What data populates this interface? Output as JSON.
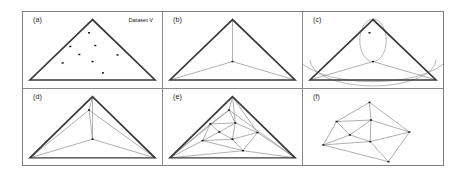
{
  "figure": {
    "width": 466,
    "height": 177,
    "background": "#ffffff",
    "frame_color": "#7d7d7d",
    "divider_color": "#8a8a8a"
  },
  "style": {
    "hull_color": "#3a3a3a",
    "hull_width": 1.5,
    "edge_color": "#8f8f8f",
    "edge_width": 0.6,
    "arc_color": "#9a9a9a",
    "arc_width": 0.6,
    "point_color": "#111111",
    "point_size": 1.5
  },
  "panels": [
    {
      "id": "a",
      "label": "(a)",
      "caption": "Dataset V",
      "has_caption": true,
      "super_triangle": [
        [
          50,
          8
        ],
        [
          5,
          72
        ],
        [
          95,
          72
        ]
      ],
      "show_hull": true,
      "show_super_edges": false,
      "points": [
        [
          47.5,
          22.0
        ],
        [
          34.0,
          36.5
        ],
        [
          52.0,
          35.5
        ],
        [
          40.5,
          45.0
        ],
        [
          28.5,
          54.0
        ],
        [
          50.0,
          52.5
        ],
        [
          68.0,
          45.5
        ],
        [
          57.5,
          64.5
        ]
      ],
      "edges": [],
      "arcs": []
    },
    {
      "id": "b",
      "label": "(b)",
      "caption": "",
      "has_caption": false,
      "super_triangle": [
        [
          50,
          8
        ],
        [
          5,
          72
        ],
        [
          95,
          72
        ]
      ],
      "show_hull": true,
      "show_super_edges": true,
      "points": [
        [
          50.0,
          52.5
        ]
      ],
      "edges": [
        [
          [
            50.0,
            52.5
          ],
          [
            50.0,
            8.0
          ]
        ],
        [
          [
            50.0,
            52.5
          ],
          [
            5.0,
            72.0
          ]
        ],
        [
          [
            50.0,
            52.5
          ],
          [
            95.0,
            72.0
          ]
        ]
      ],
      "arcs": []
    },
    {
      "id": "c",
      "label": "(c)",
      "caption": "",
      "has_caption": false,
      "super_triangle": [
        [
          50,
          8
        ],
        [
          5,
          72
        ],
        [
          95,
          72
        ]
      ],
      "show_hull": true,
      "show_super_edges": true,
      "points": [
        [
          47.5,
          22.0
        ],
        [
          50.0,
          52.5
        ]
      ],
      "edges": [
        [
          [
            50.0,
            52.5
          ],
          [
            5.0,
            72.0
          ]
        ],
        [
          [
            50.0,
            52.5
          ],
          [
            95.0,
            72.0
          ]
        ]
      ],
      "arcs": [
        {
          "cx": 50.0,
          "cy": 30.0,
          "r": 22.5,
          "sweep": "lens-left"
        },
        {
          "cx": 50.0,
          "cy": 30.0,
          "r": 22.5,
          "sweep": "lens-right"
        },
        {
          "cx": 50.0,
          "cy": 28.0,
          "r": 45.0,
          "sweep": "bottom-wide"
        },
        {
          "cx": 50.0,
          "cy": 20.0,
          "r": 55.0,
          "sweep": "bottom-wider"
        }
      ]
    },
    {
      "id": "d",
      "label": "(d)",
      "caption": "",
      "has_caption": false,
      "super_triangle": [
        [
          50,
          8
        ],
        [
          5,
          72
        ],
        [
          95,
          72
        ]
      ],
      "show_hull": true,
      "show_super_edges": true,
      "points": [
        [
          47.5,
          22.0
        ],
        [
          50.0,
          52.5
        ]
      ],
      "edges": [
        [
          [
            47.5,
            22.0
          ],
          [
            50.0,
            8.0
          ]
        ],
        [
          [
            47.5,
            22.0
          ],
          [
            5.0,
            72.0
          ]
        ],
        [
          [
            47.5,
            22.0
          ],
          [
            95.0,
            72.0
          ]
        ],
        [
          [
            47.5,
            22.0
          ],
          [
            50.0,
            52.5
          ]
        ],
        [
          [
            50.0,
            52.5
          ],
          [
            5.0,
            72.0
          ]
        ],
        [
          [
            50.0,
            52.5
          ],
          [
            95.0,
            72.0
          ]
        ],
        [
          [
            50.0,
            52.5
          ],
          [
            50.0,
            8.0
          ]
        ]
      ],
      "arcs": []
    },
    {
      "id": "e",
      "label": "(e)",
      "caption": "",
      "has_caption": false,
      "super_triangle": [
        [
          50,
          8
        ],
        [
          5,
          72
        ],
        [
          95,
          72
        ]
      ],
      "show_hull": true,
      "show_super_edges": true,
      "points": [
        [
          47.5,
          22.0
        ],
        [
          34.0,
          36.5
        ],
        [
          52.0,
          35.5
        ],
        [
          40.5,
          45.0
        ],
        [
          28.5,
          54.0
        ],
        [
          50.0,
          52.5
        ],
        [
          68.0,
          45.5
        ],
        [
          57.5,
          64.5
        ]
      ],
      "edges": [
        [
          [
            47.5,
            22.0
          ],
          [
            50.0,
            8.0
          ]
        ],
        [
          [
            47.5,
            22.0
          ],
          [
            34.0,
            36.5
          ]
        ],
        [
          [
            47.5,
            22.0
          ],
          [
            52.0,
            35.5
          ]
        ],
        [
          [
            34.0,
            36.5
          ],
          [
            52.0,
            35.5
          ]
        ],
        [
          [
            34.0,
            36.5
          ],
          [
            40.5,
            45.0
          ]
        ],
        [
          [
            34.0,
            36.5
          ],
          [
            28.5,
            54.0
          ]
        ],
        [
          [
            52.0,
            35.5
          ],
          [
            40.5,
            45.0
          ]
        ],
        [
          [
            52.0,
            35.5
          ],
          [
            50.0,
            52.5
          ]
        ],
        [
          [
            52.0,
            35.5
          ],
          [
            68.0,
            45.5
          ]
        ],
        [
          [
            40.5,
            45.0
          ],
          [
            50.0,
            52.5
          ]
        ],
        [
          [
            40.5,
            45.0
          ],
          [
            28.5,
            54.0
          ]
        ],
        [
          [
            28.5,
            54.0
          ],
          [
            50.0,
            52.5
          ]
        ],
        [
          [
            28.5,
            54.0
          ],
          [
            57.5,
            64.5
          ]
        ],
        [
          [
            28.5,
            54.0
          ],
          [
            5.0,
            72.0
          ]
        ],
        [
          [
            50.0,
            52.5
          ],
          [
            68.0,
            45.5
          ]
        ],
        [
          [
            50.0,
            52.5
          ],
          [
            57.5,
            64.5
          ]
        ],
        [
          [
            68.0,
            45.5
          ],
          [
            57.5,
            64.5
          ]
        ],
        [
          [
            68.0,
            45.5
          ],
          [
            95.0,
            72.0
          ]
        ],
        [
          [
            57.5,
            64.5
          ],
          [
            5.0,
            72.0
          ]
        ],
        [
          [
            57.5,
            64.5
          ],
          [
            95.0,
            72.0
          ]
        ],
        [
          [
            34.0,
            36.5
          ],
          [
            5.0,
            72.0
          ]
        ],
        [
          [
            47.5,
            22.0
          ],
          [
            5.0,
            72.0
          ]
        ],
        [
          [
            47.5,
            22.0
          ],
          [
            95.0,
            72.0
          ]
        ],
        [
          [
            52.0,
            35.5
          ],
          [
            50.0,
            8.0
          ]
        ],
        [
          [
            68.0,
            45.5
          ],
          [
            50.0,
            8.0
          ]
        ]
      ],
      "arcs": []
    },
    {
      "id": "f",
      "label": "(f)",
      "caption": "",
      "has_caption": false,
      "super_triangle": null,
      "show_hull": false,
      "show_super_edges": false,
      "points": [
        [
          47.5,
          14.0
        ],
        [
          24.0,
          34.0
        ],
        [
          48.5,
          32.5
        ],
        [
          33.5,
          48.0
        ],
        [
          14.5,
          58.5
        ],
        [
          48.0,
          55.0
        ],
        [
          76.0,
          45.0
        ],
        [
          61.0,
          76.0
        ]
      ],
      "edges": [
        [
          [
            47.5,
            14.0
          ],
          [
            24.0,
            34.0
          ]
        ],
        [
          [
            47.5,
            14.0
          ],
          [
            48.5,
            32.5
          ]
        ],
        [
          [
            47.5,
            14.0
          ],
          [
            76.0,
            45.0
          ]
        ],
        [
          [
            24.0,
            34.0
          ],
          [
            48.5,
            32.5
          ]
        ],
        [
          [
            24.0,
            34.0
          ],
          [
            33.5,
            48.0
          ]
        ],
        [
          [
            24.0,
            34.0
          ],
          [
            14.5,
            58.5
          ]
        ],
        [
          [
            48.5,
            32.5
          ],
          [
            33.5,
            48.0
          ]
        ],
        [
          [
            48.5,
            32.5
          ],
          [
            48.0,
            55.0
          ]
        ],
        [
          [
            48.5,
            32.5
          ],
          [
            76.0,
            45.0
          ]
        ],
        [
          [
            33.5,
            48.0
          ],
          [
            48.0,
            55.0
          ]
        ],
        [
          [
            33.5,
            48.0
          ],
          [
            14.5,
            58.5
          ]
        ],
        [
          [
            14.5,
            58.5
          ],
          [
            48.0,
            55.0
          ]
        ],
        [
          [
            14.5,
            58.5
          ],
          [
            61.0,
            76.0
          ]
        ],
        [
          [
            48.0,
            55.0
          ],
          [
            76.0,
            45.0
          ]
        ],
        [
          [
            48.0,
            55.0
          ],
          [
            61.0,
            76.0
          ]
        ],
        [
          [
            76.0,
            45.0
          ],
          [
            61.0,
            76.0
          ]
        ]
      ],
      "arcs": []
    }
  ]
}
